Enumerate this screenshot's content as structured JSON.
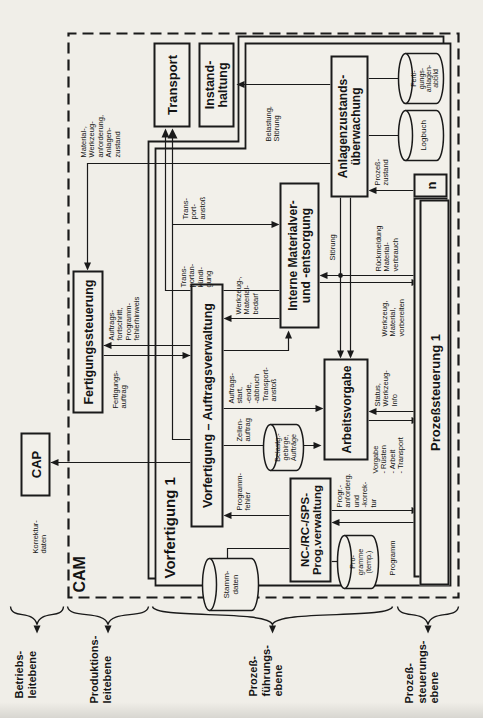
{
  "nodes": {
    "cap": "CAP",
    "cam": "CAM",
    "vorfertigung": "Vorfertigung 1",
    "fertigungssteuerung": "Fertigungssteuerung",
    "transport": "Transport",
    "instandhaltung": "Instand-\nhaltung",
    "auftragsverwaltung": "Vorfertigung – Auftragsverwaltung",
    "interne_materialversorgung": "Interne Materialver-\nund -entsorgung",
    "anlagenzustandsueberwachung": "Anlagenzustands-\nüberwachung",
    "arbeitsvorgabe": "Arbeitsvorgabe",
    "prog_verwaltung": "NC-/RC-/SPS-\nProg.verwaltung",
    "prozesssteuerung": "Prozeßsteuerung 1",
    "n_instance": "n"
  },
  "datastores": {
    "stammdaten": "Stamm-\ndaten",
    "programme_temp": "Pro-\ngramme\n(temp.)",
    "belastungsgebirge": "Belastg.-\ngebirge,\nAufträge",
    "logbuch": "Logbuch",
    "anlagenabbild": "Ferti-\ngungs-\nanlagen-\nabbild"
  },
  "levels": [
    {
      "label": "Betriebs-\nleitebene"
    },
    {
      "label": "Produktions-\nleitebene"
    },
    {
      "label": "Prozeß-\nführungs-\nebene"
    },
    {
      "label": "Prozeß-\nsteuerungs-\nebene"
    }
  ],
  "edges": {
    "korrekturdaten": "Korrektur-\ndaten",
    "material_anforderung": "Material-,\nWerkzeug-\nanforderung,\nAnlagen-\nzustand",
    "fertigungsauftrag": "Fertigungs-\nauftrag",
    "auftragsfortschritt": "Auftrags-\nfortschritt,\nProgramm-\nfehlerhinweis",
    "transportanstoss_oben": "Trans-\nport-\nanstoß",
    "transportankuendigung": "Trans-\nportan-\nkündi-\ngung",
    "belastung_stoerung": "Belastung,\nStörung",
    "prozesszustand": "Prozeß-\nzustand",
    "rueckmeldung_materialverbrauch": "Rückmeldung\nMaterial-\nverbrauch",
    "werkzeug_vorbereiten": "Werkzeug,\nMaterial,\nvorbereiten",
    "stoerung": "Störung",
    "werkzeug_materialbedarf": "Werkzeug-,\nMaterial-\nbedarf",
    "transportanstoss_mitte": "Transport-\nanstoß",
    "zellenauftrag": "Zellen-\nauftrag",
    "auftrag_start_ende": "Auftrags-\nstart,\n-ende,\n-abbruch",
    "programmfehler": "Programm-\nfehler",
    "progr_anforderung": "Progr.-\nanforderg.\nund\n-korrek-\ntur",
    "programm": "Programm",
    "vorgabe": "Vorgabe\n- Rüsten\n- Arbeit\n- Transport",
    "status_werkzeug_info": "Status,\nWerkzeug-\nInfo"
  }
}
